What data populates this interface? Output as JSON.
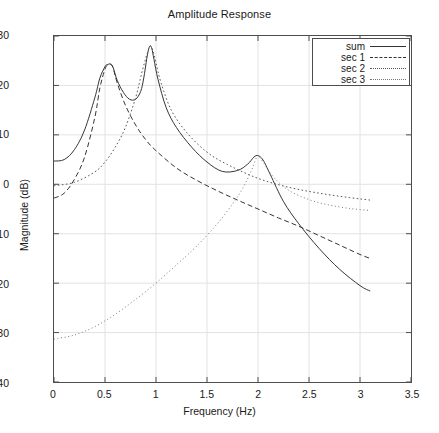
{
  "chart_data": {
    "type": "line",
    "title": "Amplitude Response",
    "xlabel": "Frequency (Hz)",
    "ylabel": "Magnitude (dB)",
    "xlim": [
      0,
      3.5
    ],
    "ylim": [
      -40,
      30
    ],
    "xticks": [
      "0",
      "0.5",
      "1",
      "1.5",
      "2",
      "2.5",
      "3",
      "3.5"
    ],
    "xtick_values": [
      0,
      0.5,
      1,
      1.5,
      2,
      2.5,
      3,
      3.5
    ],
    "yticks": [
      "30",
      "20",
      "10",
      "0",
      "-10",
      "-20",
      "-30",
      "-40"
    ],
    "ytick_values": [
      30,
      20,
      10,
      0,
      -10,
      -20,
      -30,
      -40
    ],
    "grid": true,
    "legend_position": "top-right",
    "legend": [
      "sum",
      "sec 1",
      "sec 2",
      "sec 3"
    ],
    "resonances": [
      {
        "freq": 0.555,
        "peak_db": 24.3,
        "series": "sec 1"
      },
      {
        "freq": 0.945,
        "peak_db": 28.0,
        "series": "sec 2"
      },
      {
        "freq": 2.0,
        "peak_db": 5.8,
        "series": "sec 3"
      }
    ],
    "x_data_range": [
      0,
      3.1
    ],
    "series": [
      {
        "name": "sum",
        "style": "solid",
        "color": "#333333",
        "x": [
          0,
          0.1,
          0.2,
          0.3,
          0.4,
          0.45,
          0.5,
          0.52,
          0.555,
          0.58,
          0.62,
          0.68,
          0.74,
          0.8,
          0.85,
          0.88,
          0.91,
          0.93,
          0.945,
          0.96,
          0.98,
          1.02,
          1.1,
          1.2,
          1.35,
          1.5,
          1.65,
          1.8,
          1.9,
          1.96,
          2.0,
          2.05,
          2.12,
          2.25,
          2.4,
          2.6,
          2.8,
          3.0,
          3.1
        ],
        "y": [
          4.7,
          5.0,
          7.0,
          11.0,
          17.5,
          21.5,
          23.8,
          24.2,
          24.3,
          23.6,
          21.0,
          18.6,
          17.2,
          17.2,
          18.8,
          21.5,
          25.5,
          27.5,
          28.0,
          27.4,
          25.3,
          21.2,
          15.5,
          11.5,
          7.5,
          4.5,
          2.6,
          2.8,
          4.1,
          5.5,
          5.8,
          4.9,
          2.0,
          -3.5,
          -8.0,
          -13.0,
          -17.2,
          -20.5,
          -21.6
        ]
      },
      {
        "name": "sec 1",
        "style": "dashed",
        "color": "#333333",
        "x": [
          0,
          0.1,
          0.2,
          0.3,
          0.4,
          0.45,
          0.5,
          0.53,
          0.555,
          0.58,
          0.62,
          0.7,
          0.8,
          0.9,
          1.0,
          1.2,
          1.4,
          1.6,
          1.8,
          2.0,
          2.2,
          2.4,
          2.6,
          2.8,
          3.0,
          3.1
        ],
        "y": [
          -2.8,
          -1.8,
          1.0,
          5.5,
          13.5,
          19.5,
          23.3,
          24.2,
          24.3,
          23.5,
          20.5,
          16.0,
          12.0,
          9.0,
          6.8,
          3.3,
          0.8,
          -1.3,
          -3.2,
          -5.0,
          -6.8,
          -8.5,
          -10.4,
          -12.3,
          -14.2,
          -15.0
        ]
      },
      {
        "name": "sec 2",
        "style": "dotted",
        "color": "#555555",
        "x": [
          0,
          0.2,
          0.4,
          0.5,
          0.6,
          0.7,
          0.8,
          0.86,
          0.9,
          0.93,
          0.945,
          0.97,
          1.0,
          1.05,
          1.15,
          1.3,
          1.5,
          1.7,
          2.0,
          2.3,
          2.6,
          2.9,
          3.1
        ],
        "y": [
          -0.3,
          0.4,
          2.5,
          4.5,
          7.5,
          11.5,
          17.5,
          22.5,
          25.5,
          27.5,
          28.0,
          27.0,
          24.5,
          20.5,
          15.0,
          10.5,
          6.5,
          4.0,
          1.2,
          -0.6,
          -1.8,
          -2.7,
          -3.2
        ]
      },
      {
        "name": "sec 3",
        "style": "fine-dotted",
        "color": "#777777",
        "x": [
          0,
          0.2,
          0.4,
          0.6,
          0.8,
          1.0,
          1.2,
          1.4,
          1.6,
          1.75,
          1.85,
          1.93,
          1.98,
          2.0,
          2.05,
          2.15,
          2.3,
          2.5,
          2.7,
          2.9,
          3.1
        ],
        "y": [
          -31.3,
          -30.5,
          -28.8,
          -26.3,
          -23.3,
          -20.0,
          -16.3,
          -12.5,
          -8.0,
          -4.0,
          -0.8,
          2.5,
          5.2,
          5.8,
          4.5,
          1.5,
          -1.2,
          -3.1,
          -4.2,
          -4.9,
          -5.3
        ]
      }
    ]
  }
}
